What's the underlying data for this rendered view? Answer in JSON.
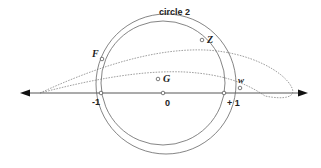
{
  "diagram": {
    "title_label": "circle 2",
    "axis": {
      "ticks": [
        {
          "label": "-1",
          "x": 101
        },
        {
          "label": "0",
          "x": 163
        },
        {
          "label": "+ 1",
          "x": 224
        }
      ]
    },
    "points": [
      {
        "name": "F",
        "label": "F"
      },
      {
        "name": "G",
        "label": "G"
      },
      {
        "name": "Z",
        "label": "Z"
      },
      {
        "name": "w",
        "label": "w"
      }
    ],
    "colors": {
      "line": "#555555",
      "axis": "#333333",
      "text": "#222222"
    }
  }
}
